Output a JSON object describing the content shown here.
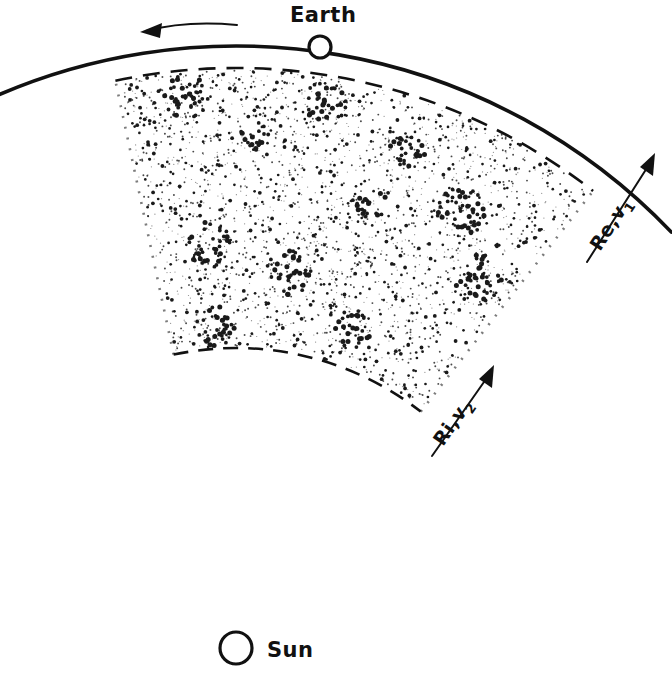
{
  "figure": {
    "background_color": "#ffffff",
    "ink_color": "#111111"
  },
  "labels": {
    "earth": "Earth",
    "sun": "Sun",
    "outer_radius": "Re",
    "outer_velocity": "v",
    "outer_velocity_sub": "1",
    "inner_radius": "Ri",
    "inner_velocity": "v",
    "inner_velocity_sub": "2",
    "separator": ",",
    "outer_label_full": "Re , v1",
    "inner_label_full": "Ri , v2"
  },
  "geometry": {
    "sun_center_x": 236,
    "sun_center_y": 648,
    "sun_radius": 16,
    "earth_center_x": 320,
    "earth_center_y": 47,
    "earth_radius": 11,
    "orbit_radius": 602,
    "outer_dashed_radius": 580,
    "inner_dashed_radius": 300,
    "sector_start_angle_deg": -102,
    "sector_end_angle_deg": -52
  },
  "annotations": {
    "orbit_direction": "counterclockwise along Earth orbit, arrow pointing left",
    "outer_arrow": "radial arrow outward marking Re and v1",
    "inner_arrow": "radial arrow outward marking Ri and v2"
  },
  "stipple": {
    "description": "dense random stipple fill of the annular sector with darker clumped concentrations",
    "base_dot_count": 2600,
    "cluster_count": 11,
    "clusters": [
      {
        "cx": 186,
        "cy": 97,
        "r": 22,
        "n": 34
      },
      {
        "cx": 327,
        "cy": 102,
        "r": 22,
        "n": 32
      },
      {
        "cx": 208,
        "cy": 243,
        "r": 22,
        "n": 32
      },
      {
        "cx": 254,
        "cy": 136,
        "r": 15,
        "n": 16
      },
      {
        "cx": 288,
        "cy": 272,
        "r": 24,
        "n": 34
      },
      {
        "cx": 216,
        "cy": 326,
        "r": 20,
        "n": 26
      },
      {
        "cx": 352,
        "cy": 330,
        "r": 20,
        "n": 26
      },
      {
        "cx": 408,
        "cy": 150,
        "r": 18,
        "n": 22
      },
      {
        "cx": 462,
        "cy": 212,
        "r": 26,
        "n": 40
      },
      {
        "cx": 479,
        "cy": 278,
        "r": 24,
        "n": 36
      },
      {
        "cx": 372,
        "cy": 205,
        "r": 16,
        "n": 18
      }
    ]
  }
}
